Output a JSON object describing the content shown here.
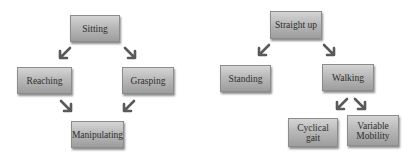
{
  "diagrams": [
    {
      "name": "left",
      "nodes": [
        {
          "label": "Sitting"
        },
        {
          "label": "Reaching"
        },
        {
          "label": "Grasping"
        },
        {
          "label": "Manipulating"
        }
      ],
      "edges": [
        {
          "from": "Sitting",
          "to": "Reaching"
        },
        {
          "from": "Sitting",
          "to": "Grasping"
        },
        {
          "from": "Reaching",
          "to": "Manipulating"
        },
        {
          "from": "Grasping",
          "to": "Manipulating"
        }
      ]
    },
    {
      "name": "right",
      "nodes": [
        {
          "label": "Straight up"
        },
        {
          "label": "Standing"
        },
        {
          "label": "Walking"
        },
        {
          "label": "Cyclical gait"
        },
        {
          "label": "Variable Mobility"
        }
      ],
      "edges": [
        {
          "from": "Straight up",
          "to": "Standing"
        },
        {
          "from": "Straight up",
          "to": "Walking"
        },
        {
          "from": "Walking",
          "to": "Cyclical gait"
        },
        {
          "from": "Walking",
          "to": "Variable Mobility"
        }
      ]
    }
  ],
  "colors": {
    "arrow": "#595959",
    "box_border": "#8c8c8c",
    "text": "#2e2e2e"
  }
}
